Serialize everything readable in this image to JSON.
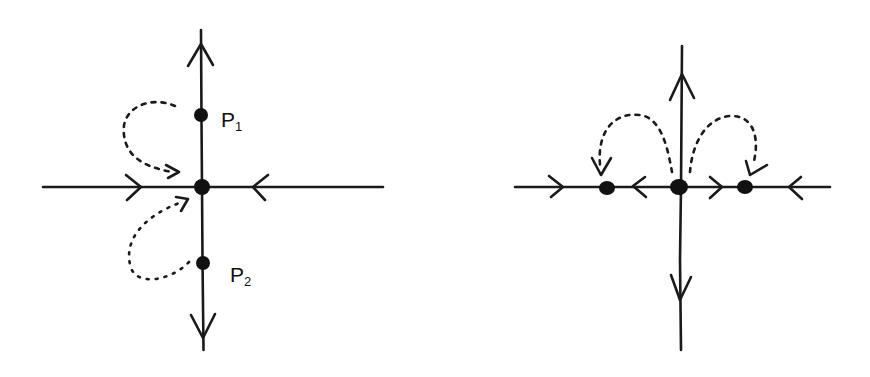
{
  "diagram": {
    "type": "phase-portrait",
    "stroke_color": "#1a1a1a",
    "panels": [
      {
        "id": "left",
        "description": "Saddle-type fixed point at origin with two fixed points P1, P2 on the vertical axis; dotted trajectories from P1 and P2 flow into the origin",
        "fixed_points": [
          {
            "name": "origin",
            "label": ""
          },
          {
            "name": "P1",
            "label": "P",
            "subscript": "1"
          },
          {
            "name": "P2",
            "label": "P",
            "subscript": "2"
          }
        ],
        "axis_flow": {
          "horizontal": "toward origin from both sides",
          "vertical": "away from origin (up and down)"
        },
        "connecting_orbits": [
          "P1 -> origin (dotted, left side)",
          "P2 -> origin (dotted, left side)"
        ]
      },
      {
        "id": "right",
        "description": "Fixed point at origin with two fixed points on the horizontal axis; dotted trajectories from origin flow to left and right fixed points",
        "fixed_points": [
          {
            "name": "left-point",
            "label": ""
          },
          {
            "name": "origin",
            "label": ""
          },
          {
            "name": "right-point",
            "label": ""
          }
        ],
        "axis_flow": {
          "horizontal": "toward left and right fixed points",
          "vertical": "away from origin (up and down)"
        },
        "connecting_orbits": [
          "origin -> left point (dotted arc)",
          "origin -> right point (dotted arc)"
        ]
      }
    ]
  },
  "labels": {
    "p1_main": "P",
    "p1_sub": "1",
    "p2_main": "P",
    "p2_sub": "2"
  }
}
